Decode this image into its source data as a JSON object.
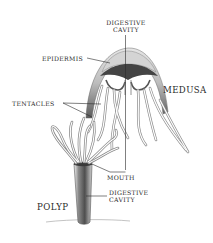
{
  "diagram": {
    "colors": {
      "background": "#ffffff",
      "ink": "#2a2a2a",
      "shade_dark": "#555555",
      "shade_mid": "#9a9a9a",
      "shade_light": "#d8d8d8"
    },
    "forms": {
      "medusa": "MEDUSA",
      "polyp": "POLYP"
    },
    "labels": {
      "digestive_cavity_top_line1": "DIGESTIVE",
      "digestive_cavity_top_line2": "CAVITY",
      "epidermis": "EPIDERMIS",
      "tentacles": "TENTACLES",
      "mouth": "MOUTH",
      "digestive_cavity_bottom_line1": "DIGESTIVE",
      "digestive_cavity_bottom_line2": "CAVITY"
    }
  }
}
